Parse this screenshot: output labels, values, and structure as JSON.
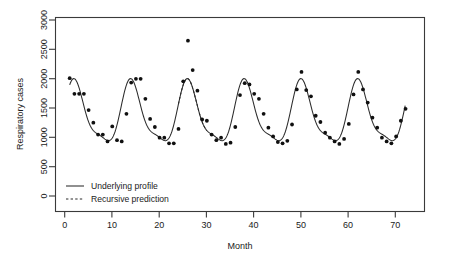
{
  "chart_data": {
    "type": "scatter",
    "title": "",
    "xlabel": "Month",
    "ylabel": "Respiratory cases",
    "xlim": [
      -2,
      76
    ],
    "ylim": [
      0,
      3100
    ],
    "grid": false,
    "xticks": [
      0,
      10,
      20,
      30,
      40,
      50,
      60,
      70
    ],
    "yticks": [
      0,
      500,
      1000,
      1500,
      2000,
      2500,
      3000
    ],
    "xticklabels": [
      "0",
      "10",
      "20",
      "30",
      "40",
      "50",
      "60",
      "70"
    ],
    "yticklabels": [
      "0",
      "500",
      "1000",
      "1500",
      "2000",
      "2500",
      "3000"
    ],
    "legend": {
      "position": "bottom-left",
      "entries": [
        {
          "label": "Underlying profile",
          "style": "solid"
        },
        {
          "label": "Recursive prediction",
          "style": "dashed"
        }
      ]
    },
    "series": [
      {
        "name": "Observed respiratory cases",
        "type": "scatter",
        "marker": "filled-circle",
        "x": [
          1,
          2,
          3,
          4,
          5,
          6,
          7,
          8,
          9,
          10,
          11,
          12,
          13,
          14,
          15,
          16,
          17,
          18,
          19,
          20,
          21,
          22,
          23,
          24,
          25,
          26,
          27,
          28,
          29,
          30,
          31,
          32,
          33,
          34,
          35,
          36,
          37,
          38,
          39,
          40,
          41,
          42,
          43,
          44,
          45,
          46,
          47,
          48,
          49,
          50,
          51,
          52,
          53,
          54,
          55,
          56,
          57,
          58,
          59,
          60,
          61,
          62,
          63,
          64,
          65,
          66,
          67,
          68,
          69,
          70,
          71,
          72
        ],
        "y": [
          2130,
          1880,
          1880,
          1880,
          1620,
          1420,
          1230,
          1230,
          1120,
          1360,
          1140,
          1120,
          1560,
          2060,
          2120,
          2120,
          1800,
          1480,
          1350,
          1180,
          1180,
          1090,
          1090,
          1320,
          2080,
          2730,
          2260,
          1930,
          1470,
          1450,
          1230,
          1140,
          1180,
          1080,
          1100,
          1350,
          1860,
          2050,
          2030,
          1880,
          1800,
          1560,
          1340,
          1200,
          1110,
          1090,
          1130,
          1390,
          1950,
          2230,
          1940,
          1840,
          1530,
          1430,
          1260,
          1180,
          1120,
          1080,
          1160,
          1400,
          1870,
          2230,
          1950,
          1740,
          1500,
          1340,
          1180,
          1120,
          1090,
          1200,
          1450,
          1640
        ]
      },
      {
        "name": "Underlying profile",
        "type": "line",
        "style": "solid",
        "x_range": [
          1,
          72
        ],
        "description": "Smooth annual seasonal curve, peaks near months 2, 14, 26, 38, 50, 62 at ~2050-2100; troughs near months 8-10, 20-22, 33-34, 45-46, 57-58, 69 at ~1080-1150"
      },
      {
        "name": "Recursive prediction",
        "type": "line",
        "style": "dashed",
        "x_range": [
          24,
          30
        ],
        "description": "Dashed predicted track overlapping the solid profile around the third seasonal peak"
      }
    ]
  }
}
